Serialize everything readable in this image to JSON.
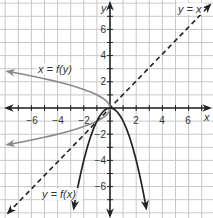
{
  "chart_data": {
    "type": "line",
    "title": "",
    "xlabel": "x",
    "ylabel": "y",
    "xlim": [
      -8,
      8
    ],
    "ylim": [
      -8,
      8
    ],
    "grid": true,
    "grid_step": 1,
    "x_ticks": [
      -6,
      -4,
      -2,
      2,
      4,
      6
    ],
    "y_ticks": [
      6,
      4,
      2,
      -2,
      -4,
      -6
    ],
    "x_tick_labels": [
      "−6",
      "−4",
      "−2",
      "2",
      "4",
      "6"
    ],
    "y_tick_labels": [
      "6",
      "4",
      "2",
      "−2",
      "−4",
      "−6"
    ],
    "series": [
      {
        "name": "y = f(x)",
        "label": "y = f(x)",
        "style": "solid",
        "color": "#222222",
        "equation": "y = -x^2",
        "x": [
          -2.77,
          -2,
          -1,
          0,
          1,
          2,
          2.77
        ],
        "y": [
          -7.67,
          -4,
          -1,
          0,
          -1,
          -4,
          -7.67
        ]
      },
      {
        "name": "x = f(y)",
        "label": "x = f(y)",
        "style": "solid",
        "color": "#8a8a8a",
        "equation": "x = -y^2",
        "x": [
          -7.84,
          -4,
          -1,
          0,
          -1,
          -4,
          -7.84
        ],
        "y": [
          2.8,
          2,
          1,
          0,
          -1,
          -2,
          -2.8
        ]
      },
      {
        "name": "y = x",
        "label": "y = x",
        "style": "dashed",
        "color": "#222222",
        "equation": "y = x",
        "x": [
          -8,
          8
        ],
        "y": [
          -8,
          8
        ]
      }
    ]
  },
  "axes": {
    "x_label": "x",
    "y_label": "y",
    "x_ticks": [
      "−6",
      "−4",
      "−2",
      "2",
      "4",
      "6"
    ],
    "y_ticks": [
      "6",
      "4",
      "2",
      "−2",
      "−4",
      "−6"
    ]
  },
  "labels": {
    "inverse": "x = f(y)",
    "function": "y = f(x)",
    "identity": "y = x"
  },
  "colors": {
    "grid": "#c8c8c8",
    "axis": "#222222",
    "function_curve": "#222222",
    "inverse_curve": "#8a8a8a",
    "identity_line": "#222222"
  }
}
